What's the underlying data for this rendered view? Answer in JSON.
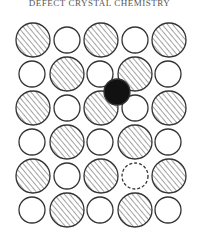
{
  "header": {
    "title": "DEFECT CRYSTAL CHEMISTRY"
  },
  "diagram": {
    "colors": {
      "stroke": "#333333",
      "hatch": "#555555",
      "interstitial": "#111111",
      "background": "#ffffff"
    },
    "large_radius": 17,
    "small_radius": 13,
    "atoms": [
      {
        "type": "large",
        "x": 33,
        "y": 40
      },
      {
        "type": "small",
        "x": 67,
        "y": 40
      },
      {
        "type": "large",
        "x": 101,
        "y": 40
      },
      {
        "type": "small",
        "x": 135,
        "y": 40
      },
      {
        "type": "large",
        "x": 169,
        "y": 40
      },
      {
        "type": "small",
        "x": 32,
        "y": 74
      },
      {
        "type": "large",
        "x": 67,
        "y": 74
      },
      {
        "type": "small",
        "x": 100,
        "y": 74
      },
      {
        "type": "large",
        "x": 135,
        "y": 74
      },
      {
        "type": "small",
        "x": 168,
        "y": 74
      },
      {
        "type": "large",
        "x": 33,
        "y": 108
      },
      {
        "type": "small",
        "x": 67,
        "y": 108
      },
      {
        "type": "large",
        "x": 101,
        "y": 108
      },
      {
        "type": "small",
        "x": 135,
        "y": 108
      },
      {
        "type": "large",
        "x": 169,
        "y": 108
      },
      {
        "type": "small",
        "x": 32,
        "y": 142
      },
      {
        "type": "large",
        "x": 67,
        "y": 142
      },
      {
        "type": "small",
        "x": 100,
        "y": 142
      },
      {
        "type": "large",
        "x": 135,
        "y": 142
      },
      {
        "type": "small",
        "x": 168,
        "y": 142
      },
      {
        "type": "large",
        "x": 33,
        "y": 176
      },
      {
        "type": "small",
        "x": 67,
        "y": 176
      },
      {
        "type": "large",
        "x": 101,
        "y": 176
      },
      {
        "type": "vacancy",
        "x": 135,
        "y": 176
      },
      {
        "type": "large",
        "x": 169,
        "y": 176
      },
      {
        "type": "small",
        "x": 32,
        "y": 210
      },
      {
        "type": "large",
        "x": 67,
        "y": 210
      },
      {
        "type": "small",
        "x": 100,
        "y": 210
      },
      {
        "type": "large",
        "x": 135,
        "y": 210
      },
      {
        "type": "small",
        "x": 168,
        "y": 210
      },
      {
        "type": "interstitial",
        "x": 117,
        "y": 92
      }
    ]
  }
}
